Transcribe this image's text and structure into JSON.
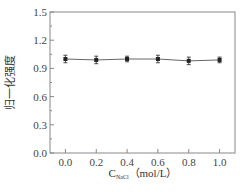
{
  "chart_data": {
    "type": "line",
    "title": "",
    "xlabel": "C_NaCl (mol/L)",
    "xlabel_main": "C",
    "xlabel_sub": "NaCl",
    "xlabel_unit": "（mol/L）",
    "ylabel": "归一化强度",
    "x": [
      0.0,
      0.2,
      0.4,
      0.6,
      0.8,
      1.0
    ],
    "series": [
      {
        "name": "normalized intensity",
        "values": [
          1.0,
          0.99,
          1.0,
          1.0,
          0.98,
          0.99
        ],
        "errors": [
          0.04,
          0.04,
          0.03,
          0.04,
          0.04,
          0.03
        ],
        "marker": "square",
        "color": "#222222"
      }
    ],
    "xticks": [
      "0.0",
      "0.2",
      "0.4",
      "0.6",
      "0.8",
      "1.0"
    ],
    "yticks": [
      "0.0",
      "0.3",
      "0.6",
      "0.9",
      "1.2",
      "1.5"
    ],
    "xlim": [
      -0.1,
      1.1
    ],
    "ylim": [
      0.0,
      1.5
    ],
    "grid": false,
    "legend": null
  },
  "colors": {
    "axis": "#888888",
    "line": "#666666",
    "marker": "#222222"
  }
}
